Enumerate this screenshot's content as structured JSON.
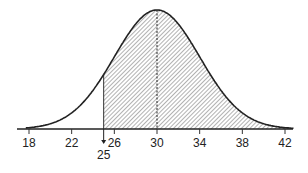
{
  "chart_data": {
    "type": "area",
    "title": "",
    "xlabel": "",
    "ylabel": "",
    "distribution": "normal",
    "mean": 30,
    "sd": 4,
    "x_ticks": [
      18,
      22,
      26,
      30,
      34,
      38,
      42
    ],
    "xlim": [
      17.4,
      43.2
    ],
    "shaded_region": {
      "from": 25,
      "to": 42.5,
      "pattern": "diagonal-hatch"
    },
    "annotations": [
      {
        "type": "arrow-marker",
        "x": 25,
        "label": "25"
      },
      {
        "type": "dashed-vertical-line",
        "x": 30
      }
    ],
    "grid": false,
    "legend": null
  },
  "colors": {
    "line": "#222222",
    "hatch": "#555555",
    "background": "#ffffff"
  }
}
